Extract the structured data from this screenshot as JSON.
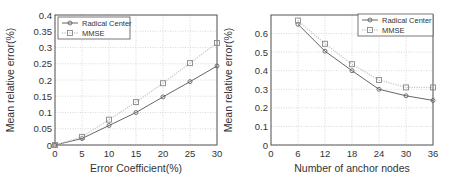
{
  "chart_data": [
    {
      "type": "line",
      "title": "",
      "xlabel": "Error Coefficient(%)",
      "ylabel": "Mean relative error(%)",
      "x": [
        0,
        5,
        10,
        15,
        20,
        25,
        30
      ],
      "xlim": [
        0,
        30
      ],
      "ylim": [
        0,
        0.4
      ],
      "xticks": [
        0,
        5,
        10,
        15,
        20,
        25,
        30
      ],
      "xtick_labels": [
        "0",
        "5",
        "10",
        "15",
        "20",
        "25",
        "30"
      ],
      "yticks": [
        0,
        0.05,
        0.1,
        0.15,
        0.2,
        0.25,
        0.3,
        0.35,
        0.4
      ],
      "ytick_labels": [
        "0",
        "0.05",
        "0.1",
        "0.15",
        "0.2",
        "0.25",
        "0.3",
        "0.35",
        "0.4"
      ],
      "grid": true,
      "legend_position": "upper left",
      "series": [
        {
          "name": "Radical Center",
          "marker": "circle",
          "line": "solid",
          "color": "#555555",
          "values": [
            0.0,
            0.02,
            0.06,
            0.1,
            0.148,
            0.195,
            0.243
          ]
        },
        {
          "name": "MMSE",
          "marker": "square",
          "line": "dotted",
          "color": "#888888",
          "values": [
            0.0,
            0.025,
            0.078,
            0.132,
            0.19,
            0.252,
            0.314
          ]
        }
      ]
    },
    {
      "type": "line",
      "title": "",
      "xlabel": "Number of anchor nodes",
      "ylabel": "Mean relative error(%)",
      "x": [
        6,
        12,
        18,
        24,
        30,
        36
      ],
      "xlim": [
        0,
        36
      ],
      "ylim": [
        0,
        0.7
      ],
      "xticks": [
        0,
        6,
        12,
        18,
        24,
        30,
        36
      ],
      "xtick_labels": [
        "0",
        "6",
        "12",
        "18",
        "24",
        "30",
        "36"
      ],
      "yticks": [
        0,
        0.1,
        0.2,
        0.3,
        0.4,
        0.5,
        0.6
      ],
      "ytick_labels": [
        "0",
        "0.1",
        "0.2",
        "0.3",
        "0.4",
        "0.5",
        "0.6"
      ],
      "grid": true,
      "legend_position": "upper right",
      "series": [
        {
          "name": "Radical Center",
          "marker": "circle",
          "line": "solid",
          "color": "#555555",
          "values": [
            0.65,
            0.505,
            0.4,
            0.3,
            0.265,
            0.24
          ]
        },
        {
          "name": "MMSE",
          "marker": "square",
          "line": "dotted",
          "color": "#888888",
          "values": [
            0.67,
            0.545,
            0.435,
            0.35,
            0.31,
            0.31
          ]
        }
      ]
    }
  ],
  "layout": {
    "plots": [
      {
        "left": 55,
        "top": 15,
        "right": 217,
        "bottom": 145,
        "ylabel_x": 14,
        "legend": {
          "x": 58,
          "y": 17,
          "w": 72,
          "h": 22
        }
      },
      {
        "left": 271,
        "top": 15,
        "right": 433,
        "bottom": 145,
        "ylabel_x": 232,
        "legend": {
          "x": 358,
          "y": 14,
          "w": 75,
          "h": 22
        }
      }
    ]
  }
}
